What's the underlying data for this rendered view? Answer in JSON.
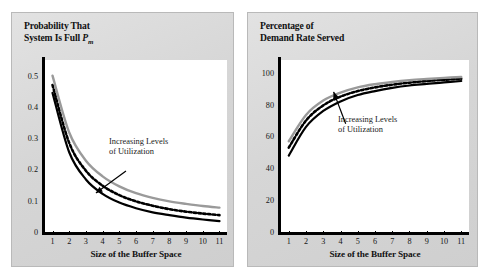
{
  "figure": {
    "background": "#ffffff",
    "panel_color": "#d9d9d9"
  },
  "colors": {
    "curve_solid_black": "#000000",
    "curve_dotted_black": "#000000",
    "curve_gray": "#9a9a9a",
    "axis": "#000000",
    "plot_background": "#ffffff",
    "text": "#111111"
  },
  "left_chart": {
    "title_line1": "Probability That",
    "title_line2_prefix": "System Is Full ",
    "title_symbol": "P",
    "title_subscript": "m",
    "annotation_line1": "Increasing Levels",
    "annotation_line2": "of Utilization",
    "xaxis_title": "Size of the Buffer Space"
  },
  "right_chart": {
    "title_line1": "Percentage of",
    "title_line2": "Demand Rate Served",
    "annotation_line1": "Increasing Levels",
    "annotation_line2": "of Utilization",
    "xaxis_title": "Size of the Buffer Space"
  },
  "chart_data": [
    {
      "type": "line",
      "id": "probability-system-full",
      "title": "Probability That System Is Full Pm",
      "xlabel": "Size of the Buffer Space",
      "ylabel": "Probability That System Is Full Pm",
      "x": [
        1,
        2,
        3,
        4,
        5,
        6,
        7,
        8,
        9,
        10,
        11
      ],
      "xlim": [
        0.55,
        11.45
      ],
      "ylim": [
        0,
        0.55
      ],
      "xticks": [
        1,
        2,
        3,
        4,
        5,
        6,
        7,
        8,
        9,
        10,
        11
      ],
      "xtick_labels": [
        "1",
        "2",
        "3",
        "4",
        "5",
        "6",
        "7",
        "8",
        "9",
        "10",
        "11"
      ],
      "yticks": [
        0,
        0.1,
        0.2,
        0.3,
        0.4,
        0.5
      ],
      "ytick_labels": [
        "0",
        "0.1",
        "0.2",
        "0.3",
        "0.4",
        "0.5"
      ],
      "grid": false,
      "legend": "none",
      "annotations": [
        {
          "text": "Increasing Levels of Utilization",
          "x": 5.4,
          "y": 0.195,
          "arrow_to_x": 3.6,
          "arrow_to_y": 0.125
        }
      ],
      "series": [
        {
          "name": "Low Utilization",
          "style": "solid",
          "color": "#000000",
          "values": [
            0.445,
            0.255,
            0.168,
            0.122,
            0.094,
            0.076,
            0.063,
            0.054,
            0.046,
            0.04,
            0.035
          ]
        },
        {
          "name": "Medium Utilization",
          "style": "dotted",
          "color": "#000000",
          "values": [
            0.47,
            0.285,
            0.196,
            0.148,
            0.118,
            0.098,
            0.084,
            0.073,
            0.065,
            0.059,
            0.054
          ]
        },
        {
          "name": "High Utilization",
          "style": "solid",
          "color": "#9a9a9a",
          "values": [
            0.5,
            0.318,
            0.228,
            0.178,
            0.146,
            0.124,
            0.109,
            0.098,
            0.09,
            0.083,
            0.078
          ]
        }
      ]
    },
    {
      "type": "line",
      "id": "percentage-demand-rate-served",
      "title": "Percentage of Demand Rate Served",
      "xlabel": "Size of the Buffer Space",
      "ylabel": "Percentage of Demand Rate Served",
      "x": [
        1,
        2,
        3,
        4,
        5,
        6,
        7,
        8,
        9,
        10,
        11
      ],
      "xlim": [
        0.55,
        11.45
      ],
      "ylim": [
        0,
        108
      ],
      "xticks": [
        1,
        2,
        3,
        4,
        5,
        6,
        7,
        8,
        9,
        10,
        11
      ],
      "xtick_labels": [
        "1",
        "2",
        "3",
        "4",
        "5",
        "6",
        "7",
        "8",
        "9",
        "10",
        "11"
      ],
      "yticks": [
        0,
        20,
        40,
        60,
        80,
        100
      ],
      "ytick_labels": [
        "0",
        "20",
        "40",
        "60",
        "80",
        "100"
      ],
      "grid": false,
      "legend": "none",
      "annotations": [
        {
          "text": "Increasing Levels of Utilization",
          "x": 4.3,
          "y": 68,
          "arrow_to_x": 3.6,
          "arrow_to_y": 88
        }
      ],
      "series": [
        {
          "name": "High Utilization",
          "style": "solid",
          "color": "#000000",
          "values": [
            48,
            66,
            76,
            82,
            86,
            88.5,
            90.5,
            92,
            93,
            94,
            94.8
          ]
        },
        {
          "name": "Medium Utilization",
          "style": "dotted",
          "color": "#000000",
          "values": [
            53,
            70,
            79.5,
            85,
            88.5,
            90.8,
            92.5,
            93.8,
            94.8,
            95.6,
            96.2
          ]
        },
        {
          "name": "Low Utilization",
          "style": "solid",
          "color": "#9a9a9a",
          "values": [
            57,
            73.5,
            82.5,
            87.5,
            90.8,
            92.8,
            94.2,
            95.3,
            96.1,
            96.8,
            97.3
          ]
        }
      ]
    }
  ]
}
